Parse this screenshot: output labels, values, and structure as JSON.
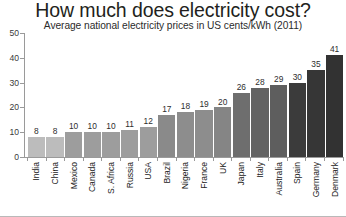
{
  "chart_data": {
    "type": "bar",
    "title": "How much does electricity cost?",
    "subtitle": "Average national electricity prices in US cents/kWh (2011)",
    "xlabel": "",
    "ylabel": "",
    "ylim": [
      0,
      50
    ],
    "yticks": [
      50,
      40,
      30,
      20,
      10,
      0
    ],
    "grid": false,
    "legend": "none",
    "value_labels": true,
    "categories": [
      "India",
      "China",
      "Mexico",
      "Canada",
      "S. Africa",
      "Russia",
      "USA",
      "Brazil",
      "Nigeria",
      "France",
      "UK",
      "Japan",
      "Italy",
      "Australia",
      "Spain",
      "Germany",
      "Denmark"
    ],
    "values": [
      8,
      8,
      10,
      10,
      10,
      11,
      12,
      17,
      18,
      19,
      20,
      26,
      28,
      29,
      30,
      35,
      41
    ],
    "bar_colors": [
      "#bcbcbc",
      "#bcbcbc",
      "#9d9d9d",
      "#9d9d9d",
      "#9d9d9d",
      "#9d9d9d",
      "#9d9d9d",
      "#8a8a8a",
      "#8d8d8d",
      "#8d8d8d",
      "#858585",
      "#6e6e6e",
      "#636363",
      "#5e5e5e",
      "#3b3b3b",
      "#363636",
      "#323232"
    ],
    "axis_color": "#9a9a9a",
    "text_color": "#231f20",
    "background": "#ffffff"
  }
}
